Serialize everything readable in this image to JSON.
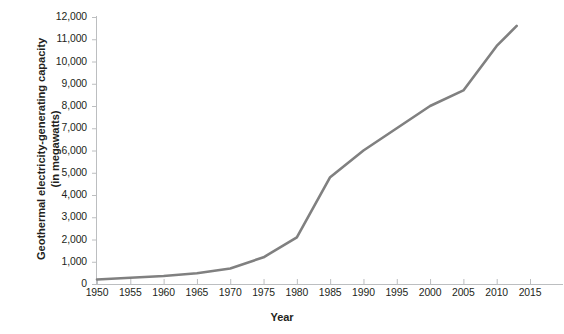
{
  "chart_data": {
    "type": "line",
    "title": "",
    "xlabel": "Year",
    "ylabel": "Geothermal electricity-generating capacity (in megawatts)",
    "ylabel_line1": "Geothermal electricity-generating capacity",
    "ylabel_line2": "(in megawatts)",
    "xlim": [
      1950,
      2015
    ],
    "ylim": [
      0,
      12000
    ],
    "grid": false,
    "legend": null,
    "line_color": "#808080",
    "x": [
      1950,
      1955,
      1960,
      1965,
      1970,
      1975,
      1980,
      1985,
      1990,
      1995,
      2000,
      2005,
      2010,
      2013
    ],
    "values": [
      200,
      280,
      360,
      480,
      700,
      1200,
      2100,
      4800,
      6000,
      7000,
      8000,
      8700,
      10700,
      11600
    ],
    "series": [
      {
        "name": "Geothermal electricity-generating capacity",
        "values": [
          200,
          280,
          360,
          480,
          700,
          1200,
          2100,
          4800,
          6000,
          7000,
          8000,
          8700,
          10700,
          11600
        ]
      }
    ],
    "x_tick_labels": [
      "1950",
      "1955",
      "1960",
      "1965",
      "1970",
      "1975",
      "1980",
      "1985",
      "1990",
      "1995",
      "2000",
      "2005",
      "2010",
      "2015"
    ],
    "x_tick_values": [
      1950,
      1955,
      1960,
      1965,
      1970,
      1975,
      1980,
      1985,
      1990,
      1995,
      2000,
      2005,
      2010,
      2015
    ],
    "y_tick_labels": [
      "0",
      "1,000",
      "2,000",
      "3,000",
      "4,000",
      "5,000",
      "6,000",
      "7,000",
      "8,000",
      "9,000",
      "10,000",
      "11,000",
      "12,000"
    ],
    "y_tick_values": [
      0,
      1000,
      2000,
      3000,
      4000,
      5000,
      6000,
      7000,
      8000,
      9000,
      10000,
      11000,
      12000
    ]
  }
}
